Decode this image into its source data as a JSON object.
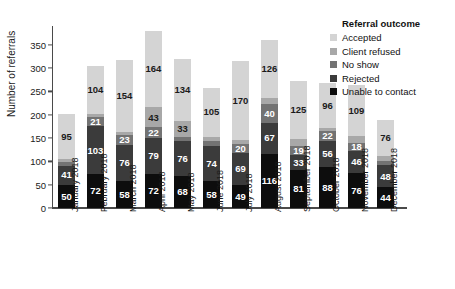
{
  "chart_data": {
    "type": "bar",
    "subtype": "stacked-bar",
    "title": "",
    "xlabel": "",
    "ylabel": "Number of referrals",
    "ylim": [
      0,
      390
    ],
    "yticks": [
      0,
      50,
      100,
      150,
      200,
      250,
      300,
      350
    ],
    "grid": false,
    "legend_position": "top-right",
    "legend_title": "Referral outcome",
    "categories": [
      "January 2018",
      "February 2018",
      "March 2018",
      "April 2018",
      "May 2018",
      "June 2018",
      "July 2018",
      "August 2018",
      "September 2018",
      "October 2018",
      "November 2018",
      "December 2018"
    ],
    "series": [
      {
        "name": "Unable to contact",
        "color": "#0d0d0d",
        "label_color": "#ffffff",
        "values": [
          50,
          72,
          58,
          72,
          68,
          58,
          49,
          116,
          81,
          88,
          76,
          44
        ],
        "labels": [
          "50",
          "72",
          "58",
          "72",
          "68",
          "58",
          "49",
          "116",
          "81",
          "88",
          "76",
          "44"
        ]
      },
      {
        "name": "Rejected",
        "color": "#3b3b3b",
        "label_color": "#ffffff",
        "values": [
          41,
          103,
          76,
          79,
          76,
          74,
          69,
          67,
          33,
          56,
          46,
          48
        ],
        "labels": [
          "41",
          "103",
          "76",
          "79",
          "76",
          "74",
          "69",
          "67",
          "33",
          "56",
          "46",
          "48"
        ]
      },
      {
        "name": "No show",
        "color": "#737373",
        "label_color": "#ffffff",
        "values": [
          7,
          21,
          23,
          22,
          9,
          12,
          20,
          40,
          19,
          22,
          18,
          9
        ],
        "labels": [
          "",
          "21",
          "23",
          "22",
          "",
          "",
          "20",
          "40",
          "19",
          "22",
          "18",
          ""
        ]
      },
      {
        "name": "Client refused",
        "color": "#a8a8a8",
        "label_color": "#1a1a1a",
        "values": [
          8,
          5,
          6,
          43,
          33,
          9,
          7,
          12,
          15,
          5,
          14,
          11
        ],
        "labels": [
          "",
          "",
          "",
          "43",
          "33",
          "",
          "",
          "",
          "",
          "",
          "",
          ""
        ]
      },
      {
        "name": "Accepted",
        "color": "#d4d4d4",
        "label_color": "#1a1a1a",
        "values": [
          95,
          104,
          154,
          164,
          134,
          105,
          170,
          126,
          125,
          96,
          109,
          76
        ],
        "labels": [
          "95",
          "104",
          "154",
          "164",
          "134",
          "105",
          "170",
          "126",
          "125",
          "96",
          "109",
          "76"
        ]
      }
    ]
  },
  "legend": {
    "title": "Referral outcome",
    "items": [
      {
        "label": "Accepted",
        "color": "#d4d4d4"
      },
      {
        "label": "Client refused",
        "color": "#a8a8a8"
      },
      {
        "label": "No show",
        "color": "#737373"
      },
      {
        "label": "Rejected",
        "color": "#3b3b3b"
      },
      {
        "label": "Unable to contact",
        "color": "#0d0d0d"
      }
    ]
  },
  "axes": {
    "y_title": "Number of referrals",
    "y_ticks": [
      "0",
      "50",
      "100",
      "150",
      "200",
      "250",
      "300",
      "350"
    ],
    "x_ticks": [
      "January 2018",
      "February 2018",
      "March 2018",
      "April 2018",
      "May 2018",
      "June 2018",
      "July 2018",
      "August 2018",
      "September 2018",
      "October 2018",
      "November 2018",
      "December 2018"
    ]
  }
}
